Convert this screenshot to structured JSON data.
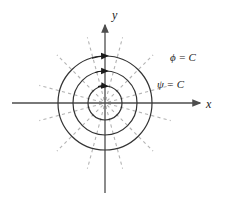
{
  "figure": {
    "background_color": "#ffffff"
  },
  "axes": {
    "x_label": "x",
    "y_label": "y",
    "axis_color": "#4d4d4d",
    "origin": {
      "x": 105,
      "y": 103
    },
    "x_axis": {
      "start_x": 12,
      "end_x": 203,
      "y": 103,
      "arrow": "right"
    },
    "y_axis": {
      "x": 105,
      "start_y": 193,
      "end_y": 22,
      "arrow": "up"
    }
  },
  "curves": {
    "circles": {
      "label": "ψ = C",
      "label_name": "psi-equals-C",
      "color": "#333333",
      "style": "solid",
      "count": 3,
      "radii": [
        17,
        32,
        47
      ],
      "arrow_direction": "clockwise",
      "arrow_positions": [
        "top of each circle on positive y-axis"
      ]
    },
    "rays": {
      "label": "ϕ = C",
      "label_name": "phi-equals-C",
      "color": "#b3b3b3",
      "style": "dashed",
      "count": 12,
      "angles_deg": [
        15,
        45,
        75,
        105,
        135,
        165,
        195,
        225,
        255,
        285,
        315,
        345
      ],
      "inner_radius": 3,
      "outer_radius": 68
    }
  },
  "labels": {
    "phi_label": "ϕ = C",
    "psi_label": "ψ = C",
    "x_axis_label": "x",
    "y_axis_label": "y"
  }
}
